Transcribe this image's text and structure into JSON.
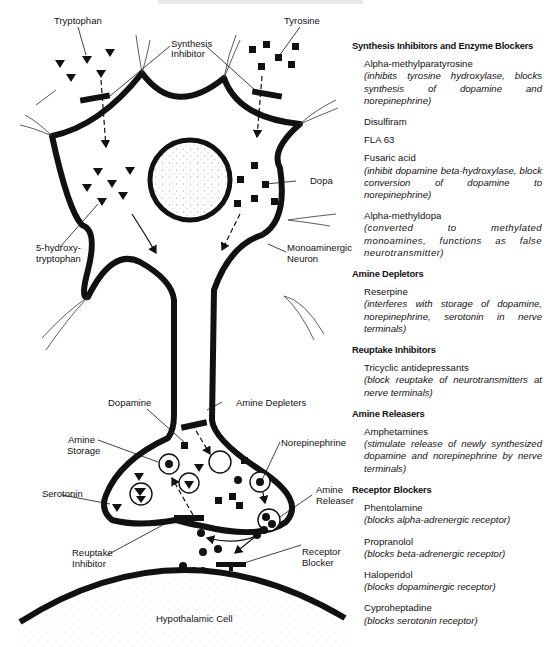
{
  "diagram": {
    "labels": {
      "tryptophan": "Tryptophan",
      "tyrosine": "Tyrosine",
      "synthesis_inhibitor_1": "Synthesis",
      "synthesis_inhibitor_2": "Inhibitor",
      "dopa": "Dopa",
      "hydroxytryptophan_1": "5-hydroxy-",
      "hydroxytryptophan_2": "tryptophan",
      "monoaminergic_1": "Monoaminergic",
      "monoaminergic_2": "Neuron",
      "dopamine": "Dopamine",
      "amine_depleters": "Amine Depleters",
      "amine_storage_1": "Amine",
      "amine_storage_2": "Storage",
      "norepinephrine": "Norepinephrine",
      "serotonin": "Serotonin",
      "amine_releaser_1": "Amine",
      "amine_releaser_2": "Releaser",
      "reuptake_inhibitor_1": "Reuptake",
      "reuptake_inhibitor_2": "Inhibitor",
      "receptor_blocker_1": "Receptor",
      "receptor_blocker_2": "Blocker",
      "hypothalamic_cell": "Hypothalamic Cell"
    },
    "colors": {
      "ink": "#111111",
      "stipple": "#9a9a9a",
      "background": "#ffffff"
    }
  },
  "legend": {
    "sections": [
      {
        "title": "Synthesis Inhibitors and Enzyme Blockers",
        "items": [
          {
            "name": "Alpha-methylparatyrosine",
            "desc": "(inhibits tyrosine hydroxylase, blocks synthesis of dopamine and norepinephrine)"
          },
          {
            "name": "Disulfiram",
            "desc": ""
          },
          {
            "name": "FLA 63",
            "desc": ""
          },
          {
            "name": "Fusaric acid",
            "desc": "(inhibit dopamine beta-hydroxylase, block conversion of dopamine to norepinephrine)"
          },
          {
            "name": "Alpha-methyldopa",
            "desc": "(converted to methylated monoamines, functions as false neurotransmitter)"
          }
        ]
      },
      {
        "title": "Amine Depletors",
        "items": [
          {
            "name": "Reserpine",
            "desc": "(interferes with storage of dopamine, norepinephrine, serotonin in nerve terminals)"
          }
        ]
      },
      {
        "title": "Reuptake Inhibitors",
        "items": [
          {
            "name": "Tricyclic antidepressants",
            "desc": "(block reuptake of neurotransmitters at nerve terminals)"
          }
        ]
      },
      {
        "title": "Amine Releasers",
        "items": [
          {
            "name": "Amphetamines",
            "desc": "(stimulate release of newly synthesized dopamine and norepinephrine by nerve terminals)"
          }
        ]
      },
      {
        "title": "Receptor Blockers",
        "items": [
          {
            "name": "Phentolamine",
            "desc": "(blocks alpha-adrenergic receptor)"
          },
          {
            "name": "Propranolol",
            "desc": "(blocks beta-adrenergic receptor)"
          },
          {
            "name": "Haloperidol",
            "desc": "(blocks dopaminergic receptor)"
          },
          {
            "name": "Cyproheptadine",
            "desc": "(blocks serotonin receptor)"
          }
        ]
      }
    ]
  }
}
